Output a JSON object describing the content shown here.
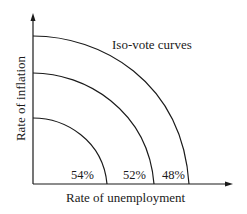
{
  "diagram": {
    "title": "Iso-vote curves",
    "x_axis_label": "Rate of unemployment",
    "y_axis_label": "Rate of inflation",
    "curves": [
      {
        "label": "54%",
        "position": "inner"
      },
      {
        "label": "52%",
        "position": "middle"
      },
      {
        "label": "48%",
        "position": "outer"
      }
    ],
    "colors": {
      "line": "#1a1a1a",
      "background": "#ffffff"
    }
  }
}
